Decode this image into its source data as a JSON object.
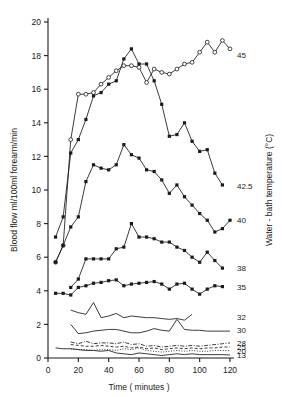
{
  "figure": {
    "background": "#ffffff",
    "ink": "#1a1a1a"
  },
  "axes": {
    "y_left": {
      "label": "Blood flow ml/100ml forearm/min",
      "ticks": [
        "0",
        "2",
        "4",
        "6",
        "8",
        "10",
        "12",
        "14",
        "16",
        "18",
        "20"
      ],
      "min": 0,
      "max": 20
    },
    "x_bottom": {
      "label": "Time ( minutes )",
      "ticks": [
        "0",
        "20",
        "40",
        "60",
        "80",
        "100",
        "120"
      ],
      "min": 0,
      "max": 120
    },
    "y_right": {
      "label": "Water - bath temperature (°C)"
    }
  },
  "series_labels": [
    {
      "text": "45",
      "value_y": 18.05,
      "name": "series-label-45"
    },
    {
      "text": "42.5",
      "value_y": 10.25,
      "name": "series-label-42-5"
    },
    {
      "text": "40",
      "value_y": 8.2,
      "name": "series-label-40"
    },
    {
      "text": "38",
      "value_y": 5.35,
      "name": "series-label-38"
    },
    {
      "text": "35",
      "value_y": 4.25,
      "name": "series-label-35"
    },
    {
      "text": "32",
      "value_y": 2.45,
      "name": "series-label-32"
    },
    {
      "text": "30",
      "value_y": 1.65,
      "name": "series-label-30"
    },
    {
      "text": "28",
      "value_y": 0.9,
      "name": "series-label-28"
    },
    {
      "text": "25",
      "value_y": 0.66,
      "name": "series-label-25"
    },
    {
      "text": "20",
      "value_y": 0.44,
      "name": "series-label-20"
    },
    {
      "text": "13",
      "value_y": 0.18,
      "name": "series-label-13"
    }
  ],
  "chart_data": {
    "type": "line",
    "title": "",
    "xlabel": "Time ( minutes )",
    "ylabel": "Blood flow ml/100ml forearm/min",
    "y2label": "Water - bath temperature (°C)",
    "xlim": [
      0,
      120
    ],
    "ylim": [
      0,
      20
    ],
    "xticks": [
      0,
      20,
      40,
      60,
      80,
      100,
      120
    ],
    "yticks": [
      0,
      2,
      4,
      6,
      8,
      10,
      12,
      14,
      16,
      18,
      20
    ],
    "grid": false,
    "legend": "right-edge labels",
    "series": [
      {
        "name": "45",
        "marker": "open-circle",
        "line": "solid",
        "x": [
          5,
          10,
          15,
          20,
          25,
          30,
          35,
          40,
          45,
          50,
          55,
          60,
          65,
          70,
          75,
          80,
          85,
          90,
          95,
          100,
          105,
          110,
          115,
          120
        ],
        "y": [
          5.7,
          6.7,
          13.0,
          15.7,
          15.7,
          15.8,
          16.3,
          16.7,
          17.1,
          17.4,
          17.4,
          17.3,
          16.4,
          17.2,
          17.0,
          16.9,
          17.2,
          17.5,
          17.6,
          18.2,
          18.8,
          18.2,
          18.9,
          18.4
        ]
      },
      {
        "name": "45-b",
        "marker": "filled-square",
        "line": "solid",
        "x": [
          5,
          10,
          15,
          20,
          25,
          30,
          35,
          40,
          45,
          50,
          55,
          60,
          65,
          70,
          75,
          80,
          85,
          90,
          95,
          100,
          105,
          110,
          115
        ],
        "y": [
          7.2,
          8.4,
          12.2,
          13.0,
          14.2,
          15.6,
          15.8,
          16.3,
          16.5,
          17.8,
          18.4,
          17.5,
          17.5,
          16.5,
          15.1,
          13.2,
          13.3,
          14.0,
          12.9,
          12.3,
          12.4,
          11.0,
          10.3
        ]
      },
      {
        "name": "42.5",
        "marker": "filled-square",
        "line": "solid",
        "x": [
          5,
          10,
          15,
          20,
          25,
          30,
          35,
          40,
          45,
          50,
          55,
          60,
          65,
          70,
          75,
          80,
          85,
          90,
          95,
          100,
          105,
          110,
          115,
          120
        ],
        "y": [
          5.7,
          6.7,
          7.8,
          8.4,
          10.5,
          11.5,
          11.3,
          11.2,
          11.5,
          12.7,
          12.1,
          11.9,
          11.2,
          11.1,
          10.6,
          9.8,
          10.3,
          9.6,
          9.1,
          8.6,
          8.2,
          7.5,
          7.7,
          8.2
        ]
      },
      {
        "name": "40",
        "marker": "filled-square",
        "line": "solid",
        "x": [
          15,
          20,
          25,
          30,
          35,
          40,
          45,
          50,
          55,
          60,
          65,
          70,
          75,
          80,
          85,
          90,
          95,
          100,
          105,
          110,
          115
        ],
        "y": [
          4.2,
          4.7,
          5.9,
          5.9,
          5.9,
          5.9,
          6.5,
          6.6,
          8.0,
          7.2,
          7.2,
          7.1,
          6.9,
          6.9,
          6.6,
          6.4,
          6.0,
          5.7,
          6.3,
          5.8,
          5.35
        ]
      },
      {
        "name": "38",
        "marker": "filled-square",
        "line": "solid",
        "x": [
          5,
          10,
          15,
          20,
          25,
          30,
          35,
          40,
          45,
          50,
          55,
          60,
          65,
          70,
          75,
          80,
          85,
          90,
          95,
          100,
          105,
          110,
          115
        ],
        "y": [
          3.85,
          3.85,
          3.75,
          4.2,
          4.3,
          4.45,
          4.5,
          4.6,
          4.65,
          4.3,
          4.4,
          4.45,
          4.5,
          4.55,
          4.4,
          4.1,
          4.4,
          4.45,
          4.1,
          3.8,
          4.1,
          4.3,
          4.25
        ]
      },
      {
        "name": "32",
        "marker": "none",
        "line": "solid",
        "x": [
          15,
          20,
          25,
          30,
          35,
          40,
          45,
          50,
          55,
          60,
          65,
          70,
          75,
          80,
          85,
          90,
          95
        ],
        "y": [
          2.85,
          2.7,
          2.6,
          3.3,
          2.4,
          2.5,
          2.65,
          2.4,
          2.5,
          2.45,
          2.4,
          2.4,
          2.35,
          2.3,
          2.35,
          2.25,
          2.6
        ]
      },
      {
        "name": "30",
        "marker": "none",
        "line": "solid",
        "x": [
          15,
          20,
          25,
          30,
          35,
          40,
          45,
          50,
          55,
          60,
          65,
          70,
          75,
          80,
          85,
          90,
          95,
          100,
          105,
          110,
          115,
          120
        ],
        "y": [
          2.0,
          1.45,
          1.5,
          1.6,
          1.65,
          1.7,
          1.7,
          1.6,
          1.5,
          1.5,
          1.6,
          1.75,
          1.65,
          1.6,
          2.3,
          1.7,
          1.65,
          1.65,
          1.6,
          1.6,
          1.6,
          1.6
        ]
      },
      {
        "name": "28",
        "marker": "none",
        "line": "dash-dot",
        "x": [
          15,
          20,
          25,
          30,
          35,
          40,
          45,
          50,
          55,
          60,
          65,
          70,
          75,
          80,
          85,
          90,
          95,
          100,
          105,
          110,
          115,
          120
        ],
        "y": [
          0.95,
          0.85,
          1.0,
          0.85,
          0.9,
          0.9,
          0.85,
          0.95,
          0.8,
          0.85,
          0.7,
          0.75,
          0.65,
          0.7,
          0.75,
          0.7,
          0.75,
          0.7,
          0.75,
          0.8,
          0.85,
          0.9
        ]
      },
      {
        "name": "25",
        "marker": "none",
        "line": "dashed",
        "x": [
          15,
          20,
          25,
          30,
          35,
          40,
          45,
          50,
          55,
          60,
          65,
          70,
          75,
          80,
          85,
          90,
          95,
          100,
          105,
          110,
          115,
          120
        ],
        "y": [
          0.8,
          0.75,
          0.7,
          0.7,
          0.75,
          0.7,
          0.65,
          0.7,
          0.6,
          0.65,
          0.55,
          0.6,
          0.5,
          0.55,
          0.6,
          0.55,
          0.6,
          0.55,
          0.6,
          0.6,
          0.65,
          0.66
        ]
      },
      {
        "name": "20",
        "marker": "none",
        "line": "dotted",
        "x": [
          15,
          20,
          25,
          30,
          35,
          40,
          45,
          50,
          55,
          60,
          65,
          70,
          75,
          80,
          85,
          90,
          95,
          100,
          105,
          110,
          115,
          120
        ],
        "y": [
          0.55,
          0.5,
          0.5,
          0.45,
          0.5,
          0.5,
          0.45,
          0.55,
          0.5,
          0.6,
          0.45,
          0.4,
          0.35,
          0.4,
          0.45,
          0.4,
          0.45,
          0.4,
          0.4,
          0.45,
          0.45,
          0.44
        ]
      },
      {
        "name": "13",
        "marker": "none",
        "line": "solid",
        "x": [
          5,
          10,
          15,
          20,
          25,
          30,
          35,
          40,
          45,
          50,
          55,
          60,
          65,
          70,
          75,
          80,
          85,
          90,
          95,
          100,
          105,
          110,
          115,
          120
        ],
        "y": [
          0.6,
          0.55,
          0.55,
          0.5,
          0.45,
          0.45,
          0.4,
          0.45,
          0.3,
          0.25,
          0.2,
          0.3,
          0.25,
          0.2,
          0.15,
          0.2,
          0.25,
          0.2,
          0.25,
          0.2,
          0.2,
          0.2,
          0.2,
          0.18
        ]
      }
    ]
  }
}
